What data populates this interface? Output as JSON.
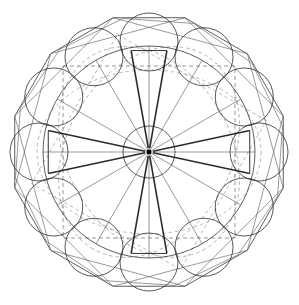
{
  "figure": {
    "canvas": {
      "width": 299,
      "height": 305,
      "background": "#ffffff"
    },
    "center": {
      "x": 149,
      "y": 152
    },
    "symmetry_order": 12,
    "colors": {
      "ink": "#1a1a1a",
      "hairline": "#555555",
      "dashed": "#6a6a6a",
      "dashed_light": "#8a8a8a",
      "thick_spoke": "#2b2b2b",
      "background": "#ffffff"
    },
    "elements": {
      "outer_polygon_label": "outer dodecagon",
      "main_circle_label": "main circumscribed circle",
      "satellite_circles_label": "ring of twelve satellite circles",
      "inner_circle_label": "central hub circle",
      "dashed_squares_label": "rotated inscribed squares",
      "spokes_label": "radial spokes",
      "thick_spokes_label": "heavy paired radial spokes",
      "hub_dot_label": "center point"
    }
  },
  "geometry": {
    "outer_polygon_radius": 139,
    "outer_polygon_sides": 12,
    "outer_polygon_rotation_deg": 15,
    "main_circle_radius": 106,
    "satellite_ring_radius": 110,
    "satellite_circle_radius": 29,
    "satellite_count": 12,
    "inner_circle_radius": 26,
    "dashed_square_half": 86,
    "dashed_square_rotations_deg": [
      0,
      30
    ],
    "dashed_ellipse_rx": 112,
    "dashed_ellipse_ry": 82,
    "spoke_angles_deg": [
      0,
      30,
      60,
      90,
      120,
      150,
      180,
      210,
      240,
      270,
      300,
      330
    ],
    "thick_spoke_pairs_deg": [
      [
        -100,
        -80
      ],
      [
        -12,
        12
      ],
      [
        80,
        100
      ],
      [
        168,
        192
      ]
    ],
    "thick_spoke_width": 1.6,
    "thick_spoke_inner_radius": 4,
    "thick_spoke_outer_radius": 103
  },
  "chart_data": {
    "type": "scatter",
    "xlabel": "",
    "ylabel": "",
    "categories": [
      "satellite-1",
      "satellite-2",
      "satellite-3",
      "satellite-4",
      "satellite-5",
      "satellite-6",
      "satellite-7",
      "satellite-8",
      "satellite-9",
      "satellite-10",
      "satellite-11",
      "satellite-12"
    ],
    "series": [
      {
        "name": "satellite circle centers (angle deg)",
        "values": [
          -90,
          -60,
          -30,
          0,
          30,
          60,
          90,
          120,
          150,
          180,
          210,
          240
        ]
      },
      {
        "name": "satellite circle radii (px)",
        "values": [
          29,
          29,
          29,
          29,
          29,
          29,
          29,
          29,
          29,
          29,
          29,
          29
        ]
      }
    ],
    "xlim": [
      0,
      299
    ],
    "ylim": [
      0,
      305
    ],
    "grid": false,
    "legend": "none"
  }
}
